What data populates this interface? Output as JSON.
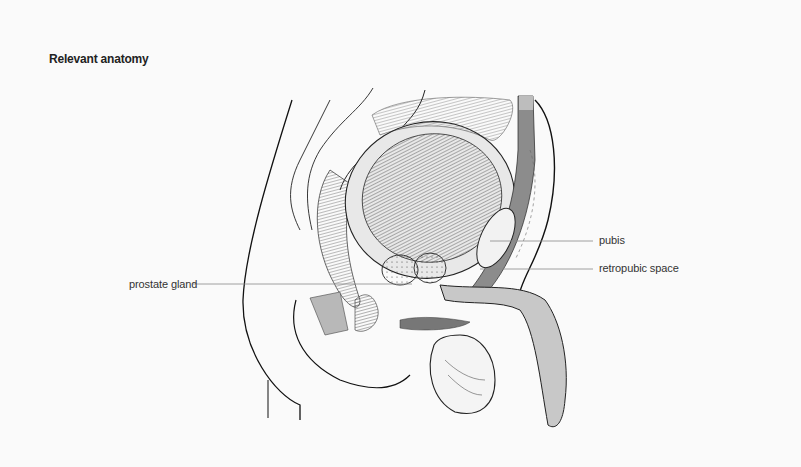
{
  "title": "Relevant anatomy",
  "labels": {
    "pubis": "pubis",
    "retropubic_space": "retropubic space",
    "prostate_gland": "prostate gland"
  },
  "colors": {
    "background": "#fafafa",
    "line": "#111111",
    "leader": "#888888",
    "shade": "#b8b8b8"
  }
}
